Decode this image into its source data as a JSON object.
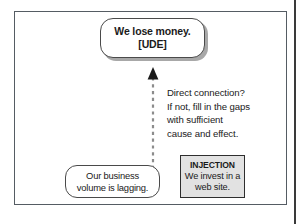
{
  "diagram": {
    "frame": {
      "border_color": "#555c63",
      "background": "#ffffff"
    },
    "nodes": {
      "ude": {
        "label": "We lose money.\n[UDE]",
        "line1": "We lose money.",
        "line2": "[UDE]",
        "shape": "rounded-rectangle",
        "fill": "#ffffff",
        "border_color": "#4a4a4a",
        "shadow_color": "#a8a8a8"
      },
      "cause": {
        "label": "Our business\nvolume is lagging.",
        "line1": "Our business",
        "line2": "volume is lagging.",
        "shape": "rounded-rectangle",
        "fill": "#ffffff",
        "border_color": "#4a4a4a"
      },
      "injection": {
        "title": "INJECTION",
        "label": "We invest in a\nweb site.",
        "line1": "We invest in a",
        "line2": "web site.",
        "shape": "rectangle",
        "fill": "#e2e2e2",
        "border_color": "#2e2e2e"
      }
    },
    "connector": {
      "style": "dashed",
      "color": "#8c8c8c",
      "arrowhead": "solid-triangle-up",
      "arrowhead_color": "#1a1a1a",
      "from": "cause",
      "to": "ude"
    },
    "annotation": {
      "text": "Direct connection?\nIf not, fill in the gaps\nwith sufficient\ncause and effect.",
      "line1": "Direct connection?",
      "line2": "If not, fill in the gaps",
      "line3": "with sufficient",
      "line4": "cause and effect."
    }
  }
}
